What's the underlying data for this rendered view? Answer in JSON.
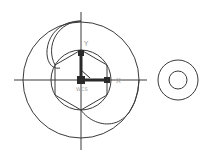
{
  "drawing": {
    "background": "#ffffff",
    "line_color": "#3a3a3a",
    "ucs_color": "#2a2a2a",
    "ucs_label_color": "#9a9a9a",
    "ucs": {
      "x_label": "X",
      "y_label": "Y",
      "origin_label": "WCS"
    },
    "entities": [
      {
        "type": "crosshair",
        "center": [
          81,
          80
        ]
      },
      {
        "type": "circle",
        "name": "outer-circle",
        "center": [
          81,
          80
        ],
        "r": 58
      },
      {
        "type": "circle",
        "name": "inner-circle",
        "center": [
          81,
          80
        ],
        "r": 30
      },
      {
        "type": "polygon",
        "name": "hexagon",
        "sides": 6,
        "center": [
          81,
          80
        ],
        "r": 30
      },
      {
        "type": "arc",
        "name": "upper-left-arc"
      },
      {
        "type": "arc",
        "name": "lower-right-arc"
      },
      {
        "type": "circle",
        "name": "right-outer-circle",
        "center": [
          178,
          80
        ],
        "r": 20
      },
      {
        "type": "circle",
        "name": "right-inner-circle",
        "center": [
          178,
          80
        ],
        "r": 9
      }
    ]
  }
}
